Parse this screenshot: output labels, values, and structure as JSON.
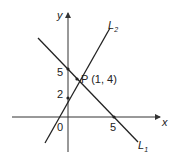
{
  "diagram": {
    "axes": {
      "x_label": "x",
      "y_label": "y",
      "origin_label": "0"
    },
    "ticks": {
      "y5": "5",
      "y2": "2",
      "x5": "5"
    },
    "lines": [
      {
        "name": "L",
        "sub": "1",
        "intercepts": {
          "x": 5,
          "y": 5
        }
      },
      {
        "name": "L",
        "sub": "2",
        "intercepts": {
          "y": 2
        }
      }
    ],
    "point": {
      "label": "P (1, 4)",
      "x": 1,
      "y": 4
    },
    "colors": {
      "line": "#222222",
      "axis": "#333333"
    }
  }
}
